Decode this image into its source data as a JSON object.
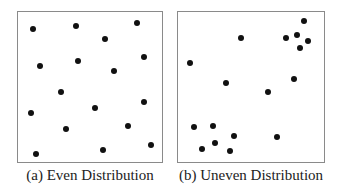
{
  "panels": [
    {
      "id": "even",
      "caption": "(a) Even Distribution",
      "box": {
        "x": 17,
        "y": 11,
        "w": 146,
        "h": 152
      },
      "points": [
        [
          33,
          29
        ],
        [
          76,
          26
        ],
        [
          137,
          23
        ],
        [
          105,
          39
        ],
        [
          40,
          66
        ],
        [
          78,
          61
        ],
        [
          144,
          57
        ],
        [
          114,
          71
        ],
        [
          61,
          92
        ],
        [
          95,
          108
        ],
        [
          144,
          102
        ],
        [
          31,
          113
        ],
        [
          66,
          129
        ],
        [
          128,
          126
        ],
        [
          151,
          145
        ],
        [
          36,
          154
        ],
        [
          103,
          150
        ]
      ]
    },
    {
      "id": "uneven",
      "caption": "(b) Uneven Distribution",
      "box": {
        "x": 177,
        "y": 11,
        "w": 148,
        "h": 152
      },
      "points": [
        [
          304,
          21
        ],
        [
          241,
          38
        ],
        [
          286,
          38
        ],
        [
          297,
          35
        ],
        [
          308,
          41
        ],
        [
          300,
          48
        ],
        [
          190,
          63
        ],
        [
          226,
          83
        ],
        [
          294,
          79
        ],
        [
          268,
          92
        ],
        [
          194,
          127
        ],
        [
          213,
          126
        ],
        [
          234,
          136
        ],
        [
          277,
          137
        ],
        [
          215,
          143
        ],
        [
          202,
          149
        ],
        [
          230,
          151
        ]
      ]
    }
  ]
}
